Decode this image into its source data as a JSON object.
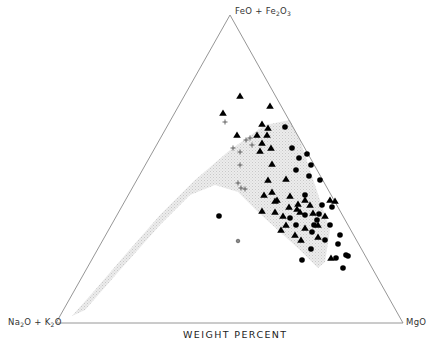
{
  "chart_data": {
    "type": "scatter",
    "subtype": "ternary",
    "title": "",
    "xlabel": "WEIGHT PERCENT",
    "apices": {
      "top": {
        "label": "FeO + Fe2O3",
        "parts": [
          "FeO + Fe",
          "2",
          "O",
          "3"
        ]
      },
      "left": {
        "label": "Na2O + K2O",
        "parts": [
          "Na",
          "2",
          "O + K",
          "2",
          "O"
        ]
      },
      "right": {
        "label": "MgO"
      }
    },
    "triangle_px": {
      "top": [
        230,
        15
      ],
      "left": [
        56,
        323
      ],
      "right": [
        403,
        323
      ]
    },
    "shaded_field": {
      "description": "stippled calc-alkaline/tholeiitic trend band from near Na2O+K2O corner curving up toward FeO apex and down to MgO side",
      "fill": "#e2e2e2",
      "outline_px": [
        [
          72,
          316
        ],
        [
          95,
          290
        ],
        [
          125,
          255
        ],
        [
          160,
          215
        ],
        [
          195,
          180
        ],
        [
          230,
          150
        ],
        [
          265,
          125
        ],
        [
          290,
          120
        ],
        [
          300,
          140
        ],
        [
          310,
          170
        ],
        [
          320,
          200
        ],
        [
          330,
          230
        ],
        [
          325,
          262
        ],
        [
          318,
          268
        ],
        [
          300,
          250
        ],
        [
          280,
          232
        ],
        [
          258,
          212
        ],
        [
          238,
          192
        ],
        [
          215,
          185
        ],
        [
          190,
          195
        ],
        [
          160,
          225
        ],
        [
          120,
          270
        ],
        [
          85,
          310
        ]
      ]
    },
    "series": [
      {
        "name": "triangles",
        "marker": "filled-triangle",
        "color": "#000000",
        "points_px": [
          [
            240,
            96
          ],
          [
            223,
            113
          ],
          [
            270,
            106
          ],
          [
            262,
            124
          ],
          [
            268,
            128
          ],
          [
            237,
            135
          ],
          [
            257,
            135
          ],
          [
            262,
            143
          ],
          [
            260,
            151
          ],
          [
            267,
            135
          ],
          [
            271,
            148
          ],
          [
            272,
            164
          ],
          [
            268,
            180
          ],
          [
            286,
            179
          ],
          [
            275,
            201
          ],
          [
            264,
            195
          ],
          [
            272,
            192
          ],
          [
            277,
            200
          ],
          [
            262,
            211
          ],
          [
            289,
            207
          ],
          [
            298,
            204
          ],
          [
            305,
            200
          ],
          [
            281,
            230
          ],
          [
            286,
            225
          ],
          [
            295,
            235
          ],
          [
            318,
            225
          ],
          [
            300,
            212
          ],
          [
            310,
            205
          ],
          [
            330,
            200
          ],
          [
            335,
            201
          ],
          [
            331,
            258
          ],
          [
            325,
            216
          ],
          [
            305,
            228
          ],
          [
            297,
            209
          ],
          [
            318,
            237
          ],
          [
            313,
            213
          ],
          [
            290,
            196
          ],
          [
            283,
            216
          ],
          [
            275,
            212
          ],
          [
            301,
            240
          ]
        ]
      },
      {
        "name": "circles",
        "marker": "filled-circle",
        "color": "#000000",
        "points_px": [
          [
            285,
            127
          ],
          [
            292,
            148
          ],
          [
            307,
            154
          ],
          [
            299,
            158
          ],
          [
            296,
            170
          ],
          [
            311,
            165
          ],
          [
            320,
            180
          ],
          [
            305,
            195
          ],
          [
            309,
            176
          ],
          [
            322,
            205
          ],
          [
            317,
            220
          ],
          [
            332,
            207
          ],
          [
            312,
            232
          ],
          [
            325,
            240
          ],
          [
            314,
            225
          ],
          [
            330,
            225
          ],
          [
            340,
            235
          ],
          [
            311,
            249
          ],
          [
            336,
            258
          ],
          [
            346,
            255
          ],
          [
            319,
            214
          ],
          [
            305,
            215
          ],
          [
            290,
            218
          ],
          [
            219,
            216
          ],
          [
            296,
            225
          ],
          [
            338,
            244
          ],
          [
            302,
            260
          ],
          [
            343,
            268
          ],
          [
            348,
            256
          ]
        ]
      },
      {
        "name": "crosses",
        "marker": "plus",
        "color": "#555555",
        "points_px": [
          [
            225,
            122
          ],
          [
            233,
            148
          ],
          [
            246,
            140
          ],
          [
            250,
            138
          ],
          [
            240,
            152
          ],
          [
            240,
            165
          ],
          [
            238,
            183
          ],
          [
            245,
            189
          ],
          [
            241,
            188
          ],
          [
            252,
            145
          ]
        ]
      },
      {
        "name": "open-circle",
        "marker": "open-circle",
        "color": "#444444",
        "points_px": [
          [
            238,
            241
          ]
        ]
      }
    ]
  }
}
